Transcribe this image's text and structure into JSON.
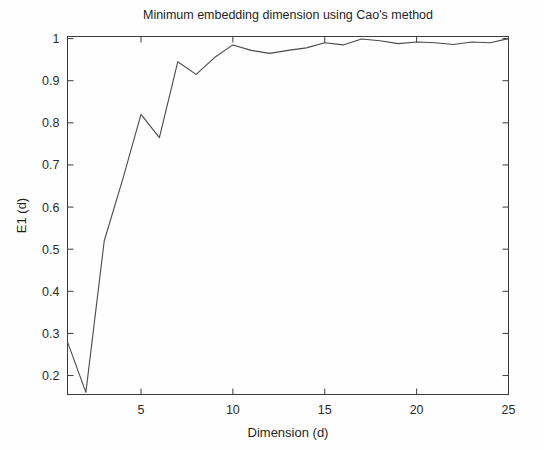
{
  "chart_data": {
    "type": "line",
    "title": "Minimum embedding dimension using Cao's method",
    "xlabel": "Dimension (d)",
    "ylabel": "E1 (d)",
    "xlim": [
      1,
      25
    ],
    "ylim": [
      0.155,
      1.005
    ],
    "grid": false,
    "legend": null,
    "xticks": [
      5,
      10,
      15,
      20,
      25
    ],
    "xtick_labels": [
      "5",
      "10",
      "15",
      "20",
      "25"
    ],
    "yticks": [
      0.2,
      0.3,
      0.4,
      0.5,
      0.6,
      0.7,
      0.8,
      0.9,
      1
    ],
    "ytick_labels": [
      "0.2",
      "0.3",
      "0.4",
      "0.5",
      "0.6",
      "0.7",
      "0.8",
      "0.9",
      "1"
    ],
    "line_color": "#4a4a4a",
    "series": [
      {
        "name": "E1(d)",
        "x": [
          1,
          2,
          3,
          4,
          5,
          6,
          7,
          8,
          9,
          10,
          11,
          12,
          13,
          14,
          15,
          16,
          17,
          18,
          19,
          20,
          21,
          22,
          23,
          24,
          25
        ],
        "values": [
          0.28,
          0.16,
          0.52,
          0.665,
          0.82,
          0.765,
          0.945,
          0.915,
          0.955,
          0.985,
          0.972,
          0.965,
          0.972,
          0.978,
          0.99,
          0.985,
          0.999,
          0.995,
          0.988,
          0.992,
          0.99,
          0.986,
          0.992,
          0.99,
          1.0
        ]
      }
    ]
  },
  "axes": {
    "y_axis_label": "E1 (d)",
    "x_axis_label": "Dimension (d)"
  }
}
